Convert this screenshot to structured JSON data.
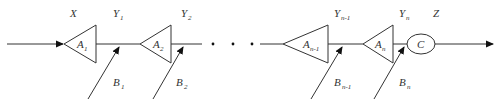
{
  "diagram": {
    "title": "",
    "input_label": "X",
    "output_label": "Z",
    "blocks": [
      {
        "id": "A1",
        "main": "A",
        "sub": "1",
        "output": {
          "main": "Y",
          "sub": "1"
        },
        "disturbance": {
          "main": "B",
          "sub": "1"
        }
      },
      {
        "id": "A2",
        "main": "A",
        "sub": "2",
        "output": {
          "main": "Y",
          "sub": "2"
        },
        "disturbance": {
          "main": "B",
          "sub": "2"
        }
      },
      {
        "id": "An-1",
        "main": "A",
        "sub": "n-1",
        "output": {
          "main": "Y",
          "sub": "n-1"
        },
        "disturbance": {
          "main": "B",
          "sub": "n-1"
        }
      },
      {
        "id": "An",
        "main": "A",
        "sub": "n",
        "output": {
          "main": "Y",
          "sub": "n"
        },
        "disturbance": {
          "main": "B",
          "sub": "n"
        }
      }
    ],
    "ellipsis": "· · ·",
    "final_block": {
      "label": "C"
    }
  }
}
